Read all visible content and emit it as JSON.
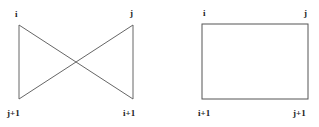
{
  "diagrams": [
    {
      "name": "crossed",
      "labels": {
        "top_left": "i",
        "top_right": "j",
        "bottom_left": "j+1",
        "bottom_right": "i+1"
      }
    },
    {
      "name": "rectangle",
      "labels": {
        "top_left": "i",
        "top_right": "j",
        "bottom_left": "i+1",
        "bottom_right": "j+1"
      }
    }
  ],
  "colors": {
    "line": "#555555",
    "text": "#222222"
  }
}
